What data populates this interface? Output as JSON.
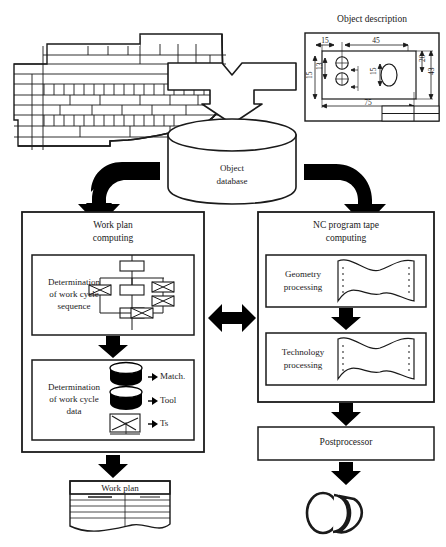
{
  "figure": {
    "kind": "process-flow-diagram",
    "domain": "CAD/CAM manufacturing planning",
    "background_color": "#ffffff",
    "line_color": "#1a1a1a",
    "fill_color": "#ffffff",
    "arrow_color": "#000000"
  },
  "inputs": {
    "drawing_sheet": {
      "name": "torn-technical-sheet",
      "caption": ""
    },
    "object_description": {
      "title": "Object description",
      "dimensions": {
        "top_left": "15",
        "top_right": "45",
        "left_stack_outer": "15",
        "left_stack_inner": "13",
        "center_vertical": "15",
        "right_inner": "20",
        "right_outer": "43",
        "bottom": "75"
      },
      "dimension_list": [
        "15",
        "45",
        "15",
        "13",
        "15",
        "20",
        "43",
        "75"
      ]
    }
  },
  "database": {
    "label": "Object\ndatabase",
    "line1": "Object",
    "line2": "database",
    "shape": "cylinder"
  },
  "left_column": {
    "title": "Work plan\ncomputing",
    "title_line1": "Work plan",
    "title_line2": "computing",
    "step1": {
      "label": "Determination\nof work cycle\nsequence",
      "line1": "Determination",
      "line2": "of work cycle",
      "line3": "sequence",
      "icon": "work-cycle-network-diagram"
    },
    "step2": {
      "label": "Determination\nof work cycle\ndata",
      "line1": "Determination",
      "line2": "of work cycle",
      "line3": "data",
      "items": [
        {
          "icon": "cylinder-icon",
          "label": "Match."
        },
        {
          "icon": "cylinder-icon",
          "label": "Tool"
        },
        {
          "icon": "graph-icon",
          "label": "Ts"
        }
      ]
    },
    "output": {
      "label": "Work plan",
      "icon": "document-icon"
    }
  },
  "right_column": {
    "title": "NC program tape\ncomputing",
    "title_line1": "NC program tape",
    "title_line2": "computing",
    "step1": {
      "label": "Geometry\nprocessing",
      "line1": "Geometry",
      "line2": "processing",
      "icon": "punched-tape-icon"
    },
    "step2": {
      "label": "Technology\nprocessing",
      "line1": "Technology",
      "line2": "processing",
      "icon": "punched-tape-icon"
    },
    "postprocessor": {
      "label": "Postprocessor"
    },
    "output": {
      "label": "",
      "icon": "tape-roll-icon"
    }
  },
  "connectors": {
    "funnel": "merge-funnel-arrow-down",
    "left_elbow": "elbow-arrow-down-left",
    "right_elbow": "elbow-arrow-down-right",
    "bidirectional": "double-headed-arrow-horizontal",
    "down_arrows": "arrow-down"
  }
}
